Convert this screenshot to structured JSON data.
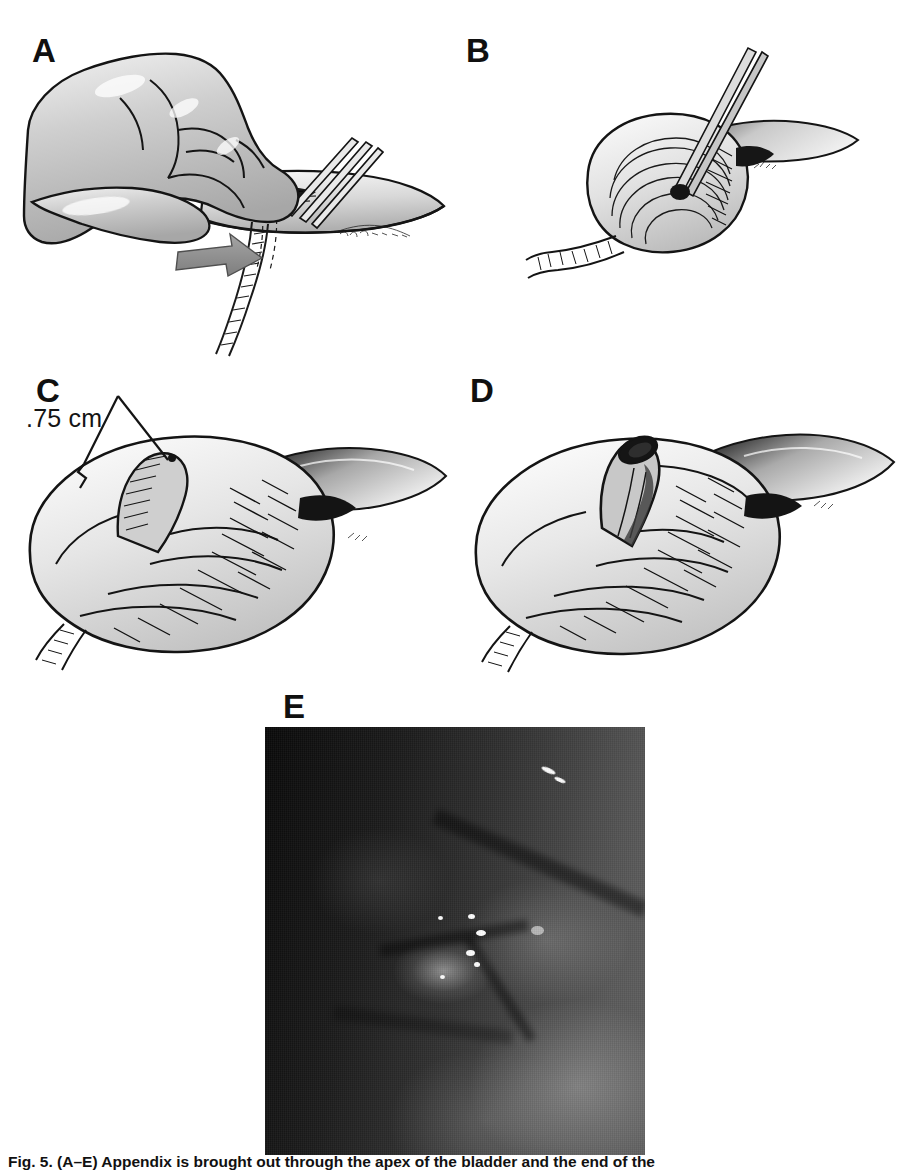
{
  "figure": {
    "caption": "Fig. 5. (A–E) Appendix is brought out through the apex of the bladder and the end of the",
    "panels": [
      {
        "id": "A",
        "label": "A",
        "name": "panel-a-hand-grasping-appendix",
        "description": "Surgeon's hand grasping the bladder wall while forceps and an arrow indicate the appendix being drawn through the bladder apex"
      },
      {
        "id": "B",
        "label": "B",
        "name": "panel-b-forceps-in-stump",
        "description": "Forceps inserted into the appendiceal stump at the bladder dome"
      },
      {
        "id": "C",
        "label": "C",
        "name": "panel-c-stump-measured",
        "description": "Appendiceal stump protruding from the bladder dome, measured at .75 cm"
      },
      {
        "id": "D",
        "label": "D",
        "name": "panel-d-open-stoma",
        "description": "Completed appendicovesicostomy stoma with open lumen at the bladder dome"
      },
      {
        "id": "E",
        "label": "E",
        "name": "panel-e-endoscopic-photograph",
        "description": "Endoscopic photograph of the mucosal surface showing the stoma opening"
      }
    ],
    "annotations": {
      "measurement": ".75 cm"
    }
  },
  "colors": {
    "ink": "#101010",
    "tissue_light": "#e6e6e6",
    "tissue_mid": "#bdbdbd",
    "tissue_dark": "#8e8e8e",
    "arrow": "#8d8d8d",
    "page": "#ffffff"
  }
}
